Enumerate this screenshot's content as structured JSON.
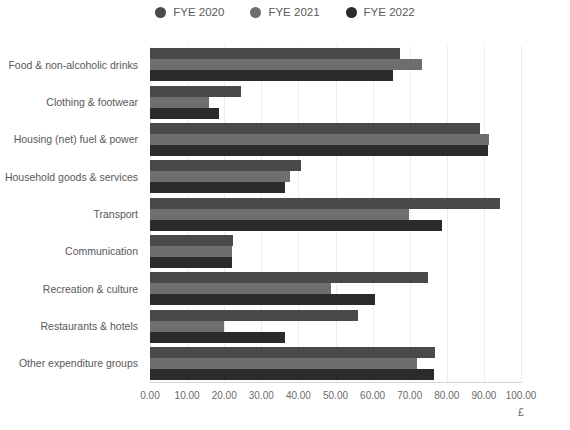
{
  "chart_data": {
    "type": "bar",
    "orientation": "horizontal",
    "title": "",
    "subtitle": "",
    "xlabel": "£",
    "ylabel": "",
    "xlim": [
      0,
      100
    ],
    "xticks": [
      "0.00",
      "10.00",
      "20.00",
      "30.00",
      "40.00",
      "50.00",
      "60.00",
      "70.00",
      "80.00",
      "90.00",
      "100.00"
    ],
    "grid": true,
    "legend_position": "top-center",
    "categories": [
      "Food & non-alcoholic drinks",
      "Clothing & footwear",
      "Housing (net) fuel & power",
      "Household goods & services",
      "Transport",
      "Communication",
      "Recreation & culture",
      "Restaurants & hotels",
      "Other expenditure groups"
    ],
    "series": [
      {
        "name": "FYE 2020",
        "color": "#4a4a4a",
        "values": [
          67.5,
          24.5,
          89.0,
          40.7,
          94.3,
          22.5,
          74.9,
          56.0,
          76.8
        ]
      },
      {
        "name": "FYE 2021",
        "color": "#6e6e6e",
        "values": [
          73.4,
          16.0,
          91.4,
          37.7,
          69.8,
          22.0,
          48.8,
          20.0,
          72.0
        ]
      },
      {
        "name": "FYE 2022",
        "color": "#2b2b2b",
        "values": [
          65.6,
          18.5,
          91.0,
          36.4,
          78.6,
          22.2,
          60.6,
          36.4,
          76.5
        ]
      }
    ]
  },
  "legend": {
    "items": [
      {
        "label": "FYE 2020",
        "color": "#4a4a4a",
        "icon": "circle-marker-icon"
      },
      {
        "label": "FYE 2021",
        "color": "#6e6e6e",
        "icon": "circle-marker-icon"
      },
      {
        "label": "FYE 2022",
        "color": "#2b2b2b",
        "icon": "circle-marker-icon"
      }
    ]
  }
}
